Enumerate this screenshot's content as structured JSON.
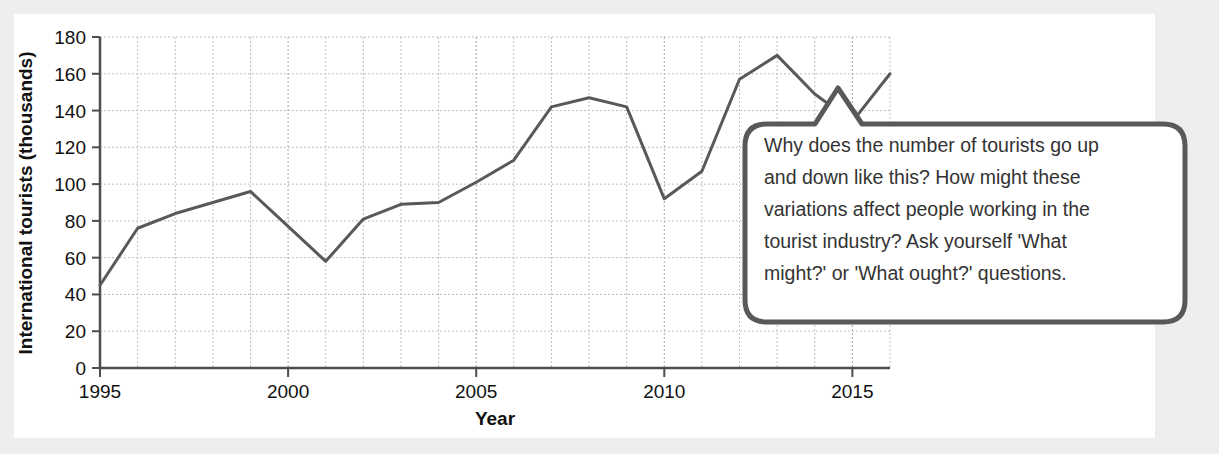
{
  "figure": {
    "background_color": "#eeeeee",
    "panel_color": "#ffffff"
  },
  "chart_data": {
    "type": "line",
    "title": "",
    "xlabel": "Year",
    "ylabel": "International tourists (thousands)",
    "xlim": [
      1995,
      2016
    ],
    "ylim": [
      0,
      180
    ],
    "xticks": [
      "1995",
      "2000",
      "2005",
      "2010",
      "2015"
    ],
    "xtick_values": [
      1995,
      2000,
      2005,
      2010,
      2015
    ],
    "yticks": [
      "0",
      "20",
      "40",
      "60",
      "80",
      "100",
      "120",
      "140",
      "160",
      "180"
    ],
    "ytick_values": [
      0,
      20,
      40,
      60,
      80,
      100,
      120,
      140,
      160,
      180
    ],
    "grid": true,
    "grid_minor_x_every": 1,
    "legend": "none",
    "line_color": "#595959",
    "line_width": 3,
    "x": [
      1995,
      1996,
      1997,
      1998,
      1999,
      2000,
      2001,
      2002,
      2003,
      2004,
      2005,
      2006,
      2007,
      2008,
      2009,
      2010,
      2011,
      2012,
      2013,
      2014,
      2015,
      2016
    ],
    "values": [
      45,
      76,
      84,
      90,
      96,
      77,
      58,
      81,
      89,
      90,
      101,
      113,
      142,
      147,
      142,
      92,
      107,
      157,
      170,
      149,
      134,
      160
    ],
    "series": [
      {
        "name": "International tourists (thousands)",
        "values": [
          45,
          76,
          84,
          90,
          96,
          77,
          58,
          81,
          89,
          90,
          101,
          113,
          142,
          147,
          142,
          92,
          107,
          157,
          170,
          149,
          134,
          160
        ]
      }
    ]
  },
  "callout": {
    "text": "Why does the number of tourists go up and down like this? How might these variations affect people working in the tourist industry? Ask yourself 'What might?' or 'What ought?' questions.",
    "lines": [
      "Why does the number of tourists go up",
      "and down like this? How might these",
      "variations affect people working in the",
      "tourist industry? Ask yourself 'What",
      "might?' or 'What ought?' questions."
    ],
    "border_color": "#595959",
    "fill_color": "#ffffff",
    "text_color": "#333333"
  }
}
